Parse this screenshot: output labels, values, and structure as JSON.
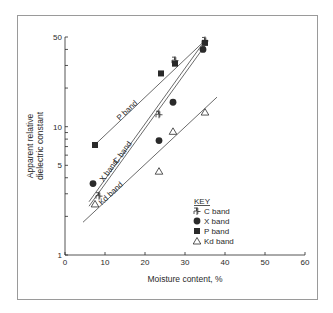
{
  "chart_data": {
    "type": "scatter",
    "title": "",
    "xlabel": "Moisture content, %",
    "ylabel_line1": "Apparent relative",
    "ylabel_line2": "dielectric constant",
    "ylabel": "Apparent relative dielectric constant",
    "xlim": [
      0,
      60
    ],
    "ylim": [
      1,
      50
    ],
    "yscale": "log",
    "xticks": [
      0,
      10,
      20,
      30,
      40,
      50,
      60
    ],
    "xtick_labels": [
      "0",
      "10",
      "20",
      "30",
      "40",
      "50",
      "60"
    ],
    "yticks_labeled": [
      1,
      5,
      10,
      50
    ],
    "ytick_labels": [
      "1",
      "5",
      "10",
      "50"
    ],
    "grid": false,
    "legend": {
      "title": "KEY",
      "position": "lower right inside",
      "entries": [
        {
          "marker": "c-glyph",
          "label": "C band"
        },
        {
          "marker": "filled-circle",
          "label": "X band"
        },
        {
          "marker": "filled-square",
          "label": "P band"
        },
        {
          "marker": "open-triangle",
          "label": "Kd band"
        }
      ]
    },
    "series": [
      {
        "name": "P band",
        "marker": "filled-square",
        "x": [
          7.5,
          24,
          27.5,
          35
        ],
        "y": [
          7.2,
          26,
          31,
          45
        ],
        "fit_line": {
          "from": [
            7,
            7.0
          ],
          "to": [
            35,
            47
          ]
        },
        "line_label": "P band"
      },
      {
        "name": "C band",
        "marker": "c-glyph",
        "x": [
          8.5,
          23.5,
          27.5,
          35
        ],
        "y": [
          2.9,
          12.5,
          33,
          47
        ],
        "fit_line": {
          "from": [
            6,
            2.6
          ],
          "to": [
            35,
            47
          ]
        },
        "line_label": "C band"
      },
      {
        "name": "X band",
        "marker": "filled-circle",
        "x": [
          7,
          23.5,
          27,
          34.5
        ],
        "y": [
          3.6,
          7.8,
          15.5,
          40
        ],
        "fit_line": {
          "from": [
            6,
            2.4
          ],
          "to": [
            35.5,
            45
          ]
        },
        "line_label": "X band"
      },
      {
        "name": "Kd band",
        "marker": "open-triangle",
        "x": [
          7.5,
          23.5,
          27,
          35
        ],
        "y": [
          2.5,
          4.5,
          9.2,
          13
        ],
        "fit_line": {
          "from": [
            4.5,
            1.8
          ],
          "to": [
            38,
            17
          ]
        },
        "line_label": "Kd band"
      }
    ]
  },
  "colors": {
    "ink": "#2a2a2a",
    "frame": "#9a9a9a",
    "background": "#ffffff"
  }
}
